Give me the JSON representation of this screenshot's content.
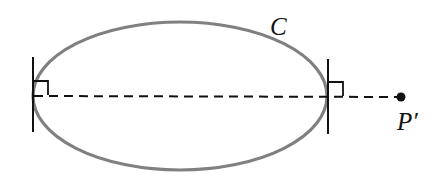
{
  "diagram": {
    "curve_label": "C",
    "point_label": "P′",
    "colors": {
      "curve": "#808080",
      "lines": "#111111",
      "background": "#ffffff"
    },
    "ellipse": {
      "cx": 180,
      "cy": 96,
      "rx": 147,
      "ry": 74
    },
    "elements": [
      "closed convex curve C (ellipse)",
      "left supporting tangent line with right-angle marker",
      "right supporting tangent line with right-angle marker",
      "dashed line through both tangent points to point P′",
      "point P′"
    ]
  }
}
